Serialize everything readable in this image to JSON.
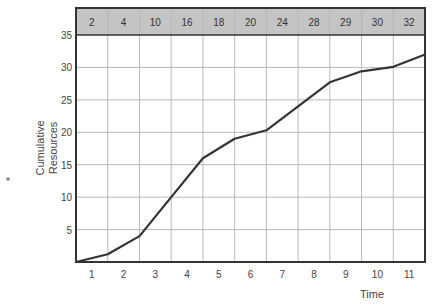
{
  "chart_data": {
    "type": "line",
    "title": "",
    "xlabel": "Time",
    "ylabel": "Cumulative Resources",
    "ylabel_marker": "*",
    "x": [
      1,
      2,
      3,
      4,
      5,
      6,
      7,
      8,
      9,
      10,
      11
    ],
    "x_tick_labels": [
      "1",
      "2",
      "3",
      "4",
      "5",
      "6",
      "7",
      "8",
      "9",
      "10",
      "11"
    ],
    "y_tick_labels": [
      "5",
      "10",
      "15",
      "20",
      "25",
      "30",
      "35"
    ],
    "ylim": [
      0,
      35
    ],
    "grid": true,
    "header_row": [
      "2",
      "4",
      "10",
      "16",
      "18",
      "20",
      "24",
      "28",
      "29",
      "30",
      "32"
    ],
    "series": [
      {
        "name": "Cumulative Resources",
        "points": [
          [
            0,
            0
          ],
          [
            1,
            1.2
          ],
          [
            2,
            4
          ],
          [
            3,
            10
          ],
          [
            4,
            16
          ],
          [
            5,
            19
          ],
          [
            6,
            20.3
          ],
          [
            7,
            24
          ],
          [
            8,
            27.7
          ],
          [
            9,
            29.4
          ],
          [
            10,
            30.1
          ],
          [
            11,
            32
          ]
        ]
      }
    ],
    "colors": {
      "line": "#333333",
      "grid": "#b8b8b8",
      "header_fill": "#c4c4c4",
      "frame": "#333333"
    }
  }
}
